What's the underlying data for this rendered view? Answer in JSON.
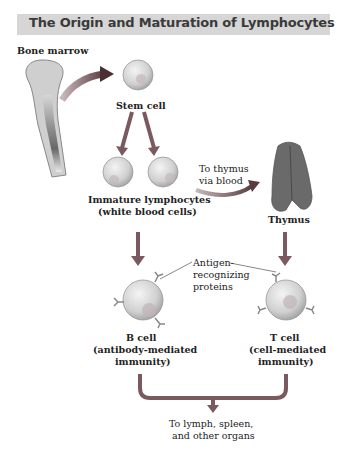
{
  "title": "The Origin and Maturation of Lymphocytes",
  "labels": {
    "bone_marrow": "Bone marrow",
    "stem_cell": "Stem cell",
    "immature_line1": "Immature lymphocytes",
    "immature_line2": "(white blood cells)",
    "to_thymus_line1": "To thymus",
    "to_thymus_line2": "via blood",
    "thymus": "Thymus",
    "antigen_line1": "Antigen-",
    "antigen_line2": "recognizing",
    "antigen_line3": "proteins",
    "b_cell": "B cell",
    "b_cell_desc1": "(antibody-mediated",
    "b_cell_desc2": "immunity)",
    "t_cell": "T cell",
    "t_cell_desc1": "(cell-mediated",
    "t_cell_desc2": "immunity)",
    "dest_line1": "To lymph, spleen,",
    "dest_line2": "and other organs"
  },
  "colors": {
    "title_bar": "#d6d6d6",
    "arrow": "#7a5a5e",
    "cell": "#d9d9d9",
    "thymus": "#6a6a6a"
  }
}
